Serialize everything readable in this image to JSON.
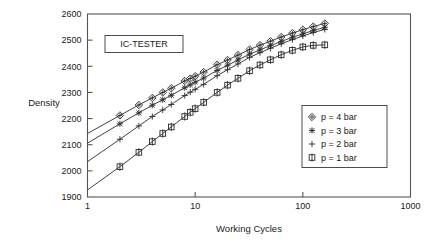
{
  "chart_data": {
    "type": "line",
    "title": "",
    "annotation": "IC-TESTER",
    "xlabel": "Working Cycles",
    "ylabel": "Density",
    "xscale": "log",
    "yscale": "linear",
    "xlim": [
      1,
      1000
    ],
    "ylim": [
      1900,
      2600
    ],
    "xticks": [
      1,
      10,
      100,
      1000
    ],
    "xtick_labels": [
      "1",
      "10",
      "100",
      "1000"
    ],
    "yticks": [
      1900,
      2000,
      2100,
      2200,
      2300,
      2400,
      2500,
      2600
    ],
    "ytick_labels": [
      "1900",
      "2000",
      "2100",
      "2200",
      "2300",
      "2400",
      "2500",
      "2600"
    ],
    "grid": false,
    "legend_position": "right-lower",
    "series": [
      {
        "name": "p = 4 bar",
        "marker": "diamond-plus-marker",
        "color": "#2b2b2b",
        "x": [
          1,
          2,
          3,
          4,
          5,
          6,
          8,
          9,
          10,
          12,
          16,
          20,
          25,
          32,
          40,
          50,
          63,
          80,
          100,
          125,
          160
        ],
        "y": [
          2143,
          2212,
          2252,
          2279,
          2300,
          2316,
          2344,
          2353,
          2362,
          2378,
          2406,
          2424,
          2443,
          2464,
          2481,
          2496,
          2512,
          2527,
          2540,
          2552,
          2564
        ]
      },
      {
        "name": "p = 3 bar",
        "marker": "asterisk-marker",
        "color": "#2b2b2b",
        "x": [
          1,
          2,
          3,
          4,
          5,
          6,
          8,
          9,
          10,
          12,
          16,
          20,
          25,
          32,
          40,
          50,
          63,
          80,
          100,
          125,
          160
        ],
        "y": [
          2106,
          2180,
          2222,
          2251,
          2272,
          2289,
          2318,
          2329,
          2339,
          2355,
          2384,
          2404,
          2424,
          2446,
          2463,
          2479,
          2495,
          2511,
          2524,
          2537,
          2549
        ]
      },
      {
        "name": "p = 2 bar",
        "marker": "plus-marker",
        "color": "#2b2b2b",
        "x": [
          1,
          2,
          3,
          4,
          5,
          6,
          8,
          9,
          10,
          12,
          16,
          20,
          25,
          32,
          40,
          50,
          63,
          80,
          100,
          125,
          160
        ],
        "y": [
          2035,
          2121,
          2172,
          2208,
          2233,
          2254,
          2288,
          2301,
          2312,
          2331,
          2364,
          2387,
          2409,
          2434,
          2452,
          2469,
          2486,
          2502,
          2516,
          2529,
          2541
        ]
      },
      {
        "name": "p = 1 bar",
        "marker": "square-plus-marker",
        "color": "#2b2b2b",
        "x": [
          1,
          2,
          3,
          4,
          5,
          6,
          8,
          9,
          10,
          12,
          16,
          20,
          25,
          32,
          40,
          50,
          63,
          80,
          100,
          125,
          160
        ],
        "y": [
          1927,
          2016,
          2071,
          2112,
          2143,
          2168,
          2208,
          2224,
          2238,
          2262,
          2300,
          2328,
          2354,
          2383,
          2405,
          2425,
          2444,
          2461,
          2474,
          2480,
          2482
        ]
      }
    ]
  },
  "legend": {
    "entries": [
      {
        "label": "p = 4 bar",
        "marker": "diamond-plus-marker"
      },
      {
        "label": "p = 3 bar",
        "marker": "asterisk-marker"
      },
      {
        "label": "p = 2 bar",
        "marker": "plus-marker"
      },
      {
        "label": "p = 1 bar",
        "marker": "square-plus-marker"
      }
    ]
  },
  "colors": {
    "axis": "#555555",
    "line": "#2b2b2b",
    "text": "#1a1a1a",
    "background": "#ffffff"
  }
}
